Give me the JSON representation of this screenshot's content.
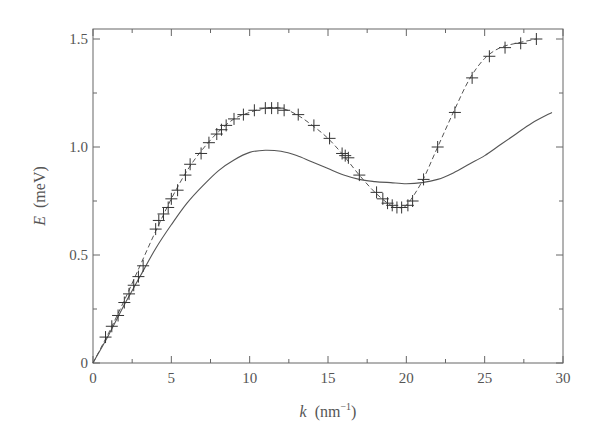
{
  "chart_data": {
    "type": "line",
    "title": "",
    "xlabel": "k (nm⁻¹)",
    "xlabel_var": "k",
    "xlabel_unit": "(nm",
    "xlabel_exp": "−1",
    "xlabel_close": ")",
    "ylabel": "E (meV)",
    "ylabel_var": "E",
    "ylabel_unit": "(meV)",
    "xlim": [
      0,
      30
    ],
    "ylim": [
      0,
      1.55
    ],
    "xticks": [
      0,
      5,
      10,
      15,
      20,
      25,
      30
    ],
    "yticks": [
      0,
      0.5,
      1.0,
      1.5
    ],
    "ytick_labels": [
      "0",
      "0.5",
      "1.0",
      "1.5"
    ],
    "xminor_step": 2.5,
    "yminor_step": 0.25,
    "grid": false,
    "legend": null,
    "series": [
      {
        "name": "experimental data",
        "style": "plus markers",
        "x": [
          0.8,
          1.2,
          1.6,
          2.0,
          2.3,
          2.6,
          2.9,
          3.2,
          4.0,
          4.2,
          4.5,
          4.8,
          5.0,
          5.4,
          5.9,
          6.2,
          6.9,
          7.4,
          7.9,
          8.2,
          8.5,
          9.0,
          9.6,
          10.3,
          11.0,
          11.4,
          11.8,
          12.2,
          13.1,
          14.1,
          15.1,
          15.9,
          16.1,
          16.3,
          17.0,
          18.1,
          18.5,
          18.8,
          19.1,
          19.4,
          19.7,
          20.1,
          20.4,
          21.1,
          22.0,
          23.1,
          24.2,
          25.3,
          26.3,
          27.3,
          28.3
        ],
        "y": [
          0.12,
          0.17,
          0.22,
          0.28,
          0.32,
          0.36,
          0.4,
          0.45,
          0.62,
          0.66,
          0.69,
          0.72,
          0.76,
          0.8,
          0.87,
          0.92,
          0.97,
          1.02,
          1.06,
          1.08,
          1.1,
          1.13,
          1.15,
          1.17,
          1.18,
          1.18,
          1.18,
          1.17,
          1.15,
          1.1,
          1.04,
          0.97,
          0.96,
          0.95,
          0.87,
          0.79,
          0.76,
          0.74,
          0.73,
          0.72,
          0.72,
          0.73,
          0.75,
          0.85,
          1.0,
          1.16,
          1.32,
          1.42,
          1.46,
          1.48,
          1.5
        ]
      },
      {
        "name": "fit through data",
        "style": "dashed line",
        "x": [
          0,
          1,
          2,
          3,
          4,
          5,
          6,
          7,
          8,
          9,
          10,
          11,
          12,
          13,
          14,
          15,
          16,
          17,
          18,
          19,
          19.5,
          20,
          21,
          22,
          23,
          24,
          25,
          26,
          27,
          28.3
        ],
        "y": [
          0,
          0.14,
          0.29,
          0.45,
          0.61,
          0.76,
          0.89,
          0.99,
          1.07,
          1.13,
          1.16,
          1.18,
          1.18,
          1.15,
          1.1,
          1.04,
          0.96,
          0.87,
          0.79,
          0.73,
          0.72,
          0.73,
          0.84,
          1.0,
          1.16,
          1.31,
          1.41,
          1.46,
          1.48,
          1.5
        ]
      },
      {
        "name": "theoretical curve",
        "style": "solid line",
        "x": [
          0,
          1,
          2,
          3,
          4,
          5,
          6,
          7,
          8,
          9,
          10,
          11,
          12,
          13,
          14,
          15,
          16,
          17,
          18,
          19,
          20,
          21,
          22,
          23,
          24,
          25,
          26,
          27,
          28,
          29.3
        ],
        "y": [
          0,
          0.13,
          0.27,
          0.4,
          0.53,
          0.64,
          0.74,
          0.82,
          0.89,
          0.94,
          0.975,
          0.985,
          0.98,
          0.96,
          0.93,
          0.9,
          0.87,
          0.85,
          0.84,
          0.835,
          0.83,
          0.835,
          0.85,
          0.88,
          0.92,
          0.96,
          1.01,
          1.06,
          1.11,
          1.16
        ]
      }
    ]
  }
}
